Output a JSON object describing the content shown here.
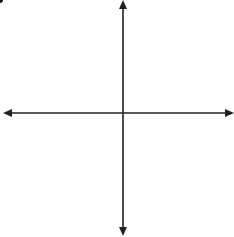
{
  "figure": {
    "type": "coordinate-plane",
    "grid": {
      "x_min": -10,
      "x_max": 10,
      "y_min": -10,
      "y_max": 10,
      "cells_x": 20,
      "cells_y": 20,
      "grid_color": "#c8c8c8",
      "axis_color": "#222222"
    },
    "points": [
      {
        "label": "A",
        "x": -6,
        "y": 4
      },
      {
        "label": "B",
        "x": -1,
        "y": -8
      }
    ]
  },
  "chart_data": {
    "type": "scatter",
    "title": "",
    "xlabel": "",
    "ylabel": "",
    "xlim": [
      -10,
      10
    ],
    "ylim": [
      -10,
      10
    ],
    "grid": true,
    "tick_labels": false,
    "series": [
      {
        "name": "points",
        "points": [
          {
            "label": "A",
            "x": -6,
            "y": 4
          },
          {
            "label": "B",
            "x": -1,
            "y": -8
          }
        ]
      }
    ]
  }
}
